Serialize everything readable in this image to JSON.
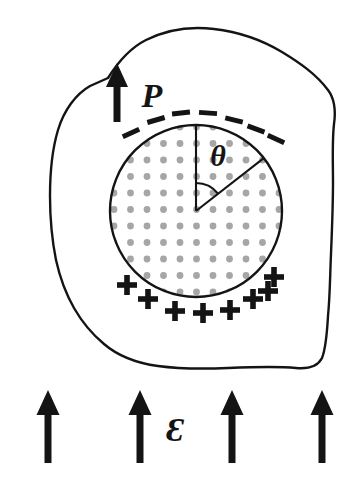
{
  "figure": {
    "background_color": "#ffffff",
    "ink_color": "#141414",
    "dot_color": "#a6a6a6",
    "width": 360,
    "height": 489
  },
  "labels": {
    "polarization": "P",
    "angle": "θ",
    "field": "Ɛ",
    "minus_sign": "–",
    "plus_sign": "+"
  },
  "blob": {
    "name": "dielectric-medium",
    "path": "M 108 78 C 118 62 130 48 146 40 C 166 30 190 26 214 29 C 240 32 262 40 282 52 C 300 63 316 74 328 90 C 334 98 336 110 334 124 C 332 142 333 162 333 182 C 333 206 332 230 331 254 C 330 276 330 296 328 316 C 327 334 326 348 322 358 C 318 366 308 369 296 368 C 276 366 252 367 228 368 C 204 369 180 369 158 366 C 136 363 118 356 104 344 C 92 334 82 322 74 308 C 66 294 60 278 56 260 C 52 240 50 218 50 196 C 50 172 52 150 58 130 C 64 110 76 94 90 86 Z",
    "stroke_width": 2.4
  },
  "sphere": {
    "name": "polarized-sphere",
    "center_x": 196,
    "center_y": 211,
    "radius": 86,
    "stroke_width": 2.4,
    "dot_spacing": 16.5,
    "dot_radius": 3.4
  },
  "radii": {
    "vertical": {
      "from_x": 196,
      "from_y": 211,
      "to_x": 196,
      "to_y": 125
    },
    "slanted_angle_deg_from_vertical": 52,
    "slanted": {
      "from_x": 196,
      "from_y": 211,
      "to_x": 264,
      "to_y": 158
    },
    "arc_radius": 28
  },
  "polarization_arrow": {
    "name": "polarization-arrow",
    "x": 117,
    "tip_y": 63,
    "tail_y": 122,
    "shaft_width": 7,
    "head_width": 22,
    "head_height": 24,
    "label_x": 152,
    "label_y": 107,
    "label_size": 34
  },
  "angle_label": {
    "x": 218,
    "y": 166,
    "size": 30
  },
  "field_label": {
    "x": 175,
    "y": 441,
    "size": 34
  },
  "minus_signs": [
    {
      "x": 131,
      "y": 133,
      "rotation": -24
    },
    {
      "x": 156,
      "y": 120,
      "rotation": -16
    },
    {
      "x": 181,
      "y": 113,
      "rotation": -6
    },
    {
      "x": 208,
      "y": 113,
      "rotation": 4
    },
    {
      "x": 234,
      "y": 120,
      "rotation": 14
    },
    {
      "x": 256,
      "y": 129,
      "rotation": 20
    },
    {
      "x": 276,
      "y": 139,
      "rotation": 24
    }
  ],
  "plus_signs": [
    {
      "x": 127,
      "y": 285
    },
    {
      "x": 148,
      "y": 299
    },
    {
      "x": 175,
      "y": 311
    },
    {
      "x": 203,
      "y": 313
    },
    {
      "x": 230,
      "y": 310
    },
    {
      "x": 253,
      "y": 299
    },
    {
      "x": 268,
      "y": 291
    },
    {
      "x": 274,
      "y": 277
    }
  ],
  "field_arrows": [
    {
      "name": "field-arrow-1",
      "x": 48,
      "tip_y": 390,
      "tail_y": 463
    },
    {
      "name": "field-arrow-2",
      "x": 140,
      "tip_y": 390,
      "tail_y": 463
    },
    {
      "name": "field-arrow-3",
      "x": 232,
      "tip_y": 390,
      "tail_y": 463
    },
    {
      "name": "field-arrow-4",
      "x": 322,
      "tip_y": 390,
      "tail_y": 463
    }
  ],
  "field_arrow_style": {
    "shaft_width": 7,
    "head_width": 23,
    "head_height": 25
  }
}
